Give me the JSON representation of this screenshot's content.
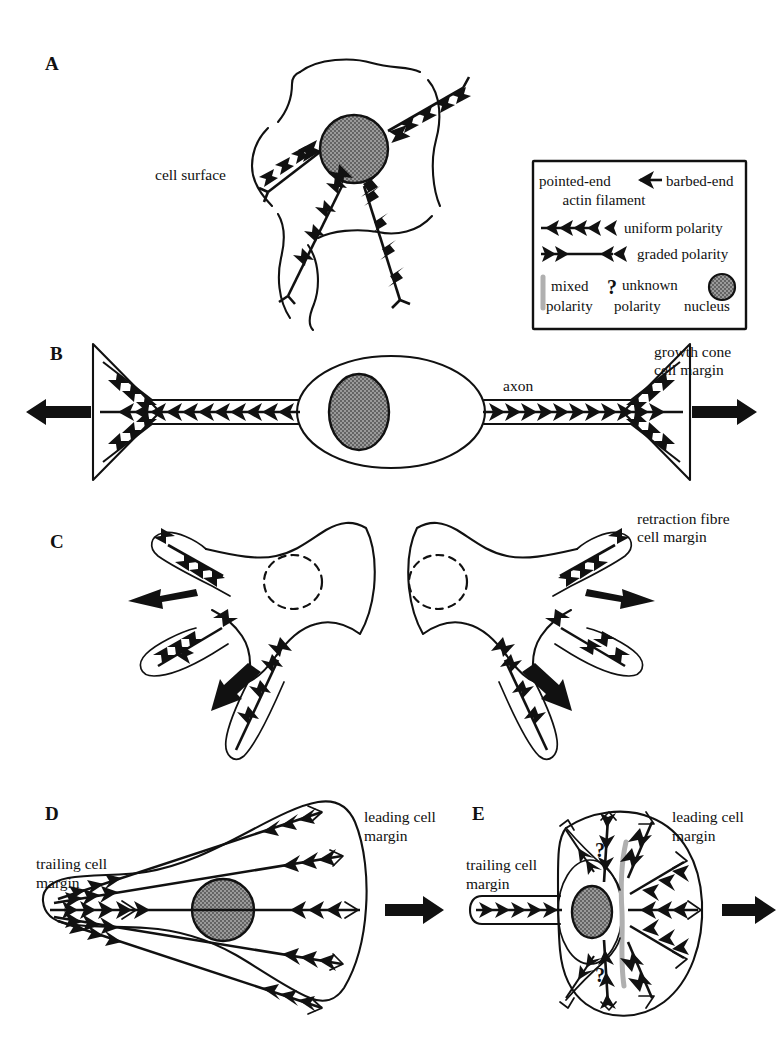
{
  "figure": {
    "background_color": "#ffffff",
    "ink_color": "#111111",
    "nucleus_fill": "#8c8c8c",
    "mixed_polarity_color": "#b0b0b0"
  },
  "panels": [
    {
      "id": "A",
      "letter": "A",
      "labels": [
        {
          "name": "cell-surface-label",
          "text": "cell surface"
        }
      ],
      "description": "Spread cell with four radial actin bundles converging on the nucleus",
      "bundle_count": 4,
      "polarity": "uniform"
    },
    {
      "id": "B",
      "letter": "B",
      "labels": [
        {
          "name": "axon-label",
          "text": "axon"
        },
        {
          "name": "growth-cone-label-line1",
          "text": "growth cone"
        },
        {
          "name": "growth-cone-label-line2",
          "text": "cell margin"
        }
      ],
      "description": "Bipolar neuron with axon and growth cones at both ends",
      "polarity": "uniform"
    },
    {
      "id": "C",
      "letter": "C",
      "labels": [
        {
          "name": "retraction-fibre-label-line1",
          "text": "retraction fibre"
        },
        {
          "name": "retraction-fibre-label-line2",
          "text": "cell margin"
        }
      ],
      "description": "Two mirror-image cells separating, each with three retraction fibres",
      "polarity": "uniform"
    },
    {
      "id": "D",
      "letter": "D",
      "labels": [
        {
          "name": "trailing-margin-label-line1",
          "text": "trailing cell"
        },
        {
          "name": "trailing-margin-label-line2",
          "text": "margin"
        },
        {
          "name": "leading-margin-label-line1",
          "text": "leading cell"
        },
        {
          "name": "leading-margin-label-line2",
          "text": "margin"
        }
      ],
      "description": "Fan-shaped migrating fibroblast with five graded-polarity bundles",
      "polarity": "graded"
    },
    {
      "id": "E",
      "letter": "E",
      "labels": [
        {
          "name": "trailing-margin-label-line1",
          "text": "trailing cell"
        },
        {
          "name": "trailing-margin-label-line2",
          "text": "margin"
        },
        {
          "name": "leading-margin-label-line1",
          "text": "leading cell"
        },
        {
          "name": "leading-margin-label-line2",
          "text": "margin"
        },
        {
          "name": "unknown-polarity-mark-top",
          "text": "?"
        },
        {
          "name": "unknown-polarity-mark-bottom",
          "text": "?"
        }
      ],
      "description": "Keratocyte with mixed-polarity band, unknown-polarity lobes and trailing tail",
      "polarity": "mixed"
    }
  ],
  "legend": {
    "name": "polarity-legend",
    "rows": [
      {
        "name": "legend-row-actin-filament",
        "left_text": "pointed-end",
        "right_text": "barbed-end",
        "caption": "actin filament",
        "symbol": "single-arrow-icon"
      },
      {
        "name": "legend-row-uniform",
        "text": "uniform polarity",
        "symbol": "uniform-polarity-icon"
      },
      {
        "name": "legend-row-graded",
        "text": "graded polarity",
        "symbol": "graded-polarity-icon"
      },
      {
        "name": "legend-row-mixed",
        "text_line1": "mixed",
        "text_line2": "polarity",
        "symbol": "mixed-polarity-bar-icon"
      },
      {
        "name": "legend-row-unknown",
        "marker": "?",
        "text_line1": "unknown",
        "text_line2": "polarity",
        "symbol": "question-mark-icon"
      },
      {
        "name": "legend-row-nucleus",
        "text": "nucleus",
        "symbol": "nucleus-circle-icon"
      }
    ]
  }
}
